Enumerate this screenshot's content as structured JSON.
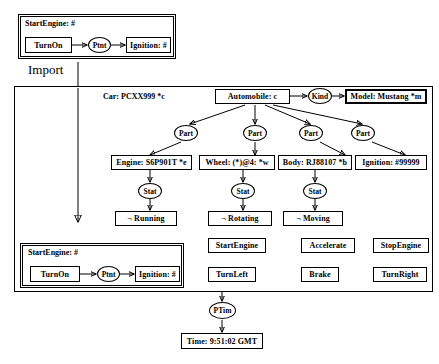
{
  "diagram": {
    "title_text": "Import",
    "import_label": "Import",
    "neg_symbol": "¬"
  },
  "top_module": {
    "label": "StartEngine: #",
    "nodes": {
      "turn_on": "TurnOn",
      "ptnt": "Ptnt",
      "ignition": "Ignition: #"
    }
  },
  "main": {
    "car_text": "Car: PCXX999 *c",
    "automobile": "Automobile: c",
    "kind": "Kind",
    "model": "Model: Mustang *m",
    "part_labels": [
      "Part",
      "Part",
      "Part",
      "Part"
    ],
    "components": [
      "Engine: S6P901T *e",
      "Wheel: (*)@4: *w",
      "Body: RJ88107 *b",
      "Ignition: #99999"
    ],
    "stat_labels": [
      "Stat",
      "Stat",
      "Stat"
    ],
    "states": [
      "¬ Running",
      "¬ Rotating",
      "¬ Moving"
    ],
    "inner_module": {
      "label": "StartEngine: #",
      "nodes": {
        "turn_on": "TurnOn",
        "ptnt": "Ptnt",
        "ignition": "Ignition: #"
      }
    },
    "actions_row1": [
      "StartEngine",
      "Accelerate",
      "StopEngine"
    ],
    "actions_row2": [
      "TurnLeft",
      "Brake",
      "TurnRight"
    ]
  },
  "footer": {
    "ptim": "PTim",
    "time": "Time: 9:51:02 GMT"
  },
  "colors": {
    "stroke": "#000000",
    "background": "#ffffff"
  }
}
